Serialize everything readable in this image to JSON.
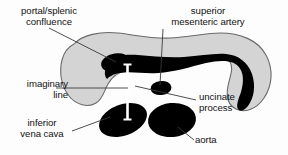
{
  "figure": {
    "labels": {
      "portal_splenic_confluence": "portal/splenic\nconfluence",
      "superior_mesenteric_artery": "superior\nmesenteric artery",
      "imaginary_line": "imaginary\nline",
      "uncinate_process": "uncinate\nprocess",
      "inferior_vena_cava": "inferior\nvena cava",
      "aorta": "aorta"
    },
    "colors": {
      "pancreas_fill": "#d4d4d4",
      "pancreas_outline": "#6a6a6a",
      "vessel_fill": "#000000",
      "imaginary_line": "#ffffff",
      "leader_line": "#3a3a3a",
      "text": "#111111",
      "background": "#fdfdfd"
    },
    "structures": [
      {
        "name": "pancreas",
        "kind": "organ-outline",
        "fill": "#d4d4d4"
      },
      {
        "name": "portal-splenic-confluence",
        "kind": "vessel",
        "fill": "#000000"
      },
      {
        "name": "splenic-vein",
        "kind": "vessel",
        "fill": "#000000"
      },
      {
        "name": "superior-mesenteric-artery",
        "kind": "vessel",
        "fill": "#000000"
      },
      {
        "name": "inferior-vena-cava",
        "kind": "vessel",
        "fill": "#000000"
      },
      {
        "name": "aorta",
        "kind": "vessel",
        "fill": "#000000"
      },
      {
        "name": "imaginary-line",
        "kind": "reference-line",
        "fill": "#ffffff"
      }
    ]
  }
}
